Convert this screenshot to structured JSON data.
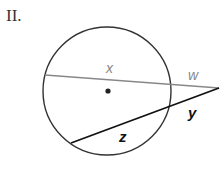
{
  "problem": {
    "number_label": "II."
  },
  "diagram": {
    "circle": {
      "cx": 107,
      "cy": 91,
      "r": 64,
      "stroke": "#333333"
    },
    "center_dot": {
      "cx": 108,
      "cy": 91
    },
    "external_point": {
      "x": 219,
      "y": 88
    },
    "secant_upper": {
      "inner_label": "x",
      "outer_label": "w",
      "color": "#888888"
    },
    "secant_lower": {
      "inner_label": "z",
      "outer_label": "y",
      "color": "#111111"
    }
  }
}
